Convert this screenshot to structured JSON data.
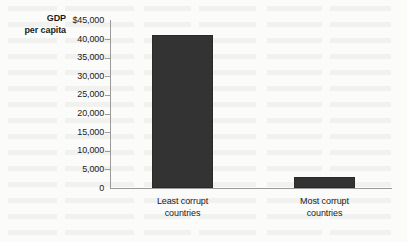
{
  "chart_data": {
    "type": "bar",
    "title": "",
    "xlabel": "",
    "ylabel": "GDP per capita",
    "ylabel_line1": "GDP",
    "ylabel_line2": "per capita",
    "categories": [
      "Least corrupt countries",
      "Most corrupt countries"
    ],
    "category_lines": [
      {
        "line1": "Least corrupt",
        "line2": "countries"
      },
      {
        "line1": "Most corrupt",
        "line2": "countries"
      }
    ],
    "values": [
      41000,
      3000
    ],
    "ylim": [
      0,
      45000
    ],
    "ytick_values": [
      45000,
      40000,
      35000,
      30000,
      25000,
      20000,
      15000,
      10000,
      5000,
      0
    ],
    "ytick_labels": [
      "$45,000",
      "40,000",
      "35,000",
      "30,000",
      "25,000",
      "20,000",
      "15,000",
      "10,000",
      "5,000",
      "0"
    ],
    "grid": false,
    "legend": null,
    "bar_color": "#333333",
    "axis_color": "#9a9a98",
    "background_color": "#fbfbfa",
    "text_color": "#1b1b1b"
  }
}
